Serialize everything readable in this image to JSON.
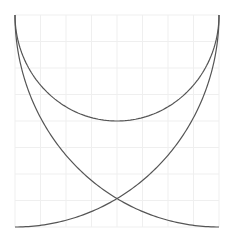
{
  "chart_data": {
    "type": "line",
    "title": "",
    "xlabel": "",
    "ylabel": "",
    "xlim": [
      0,
      8
    ],
    "ylim": [
      0,
      8
    ],
    "grid": true,
    "grid_divisions": 8,
    "legend": null,
    "axes_visible": false,
    "series": [
      {
        "name": "semi-ellipse",
        "shape": "lower half ellipse",
        "center": [
          4,
          8
        ],
        "rx": 4,
        "ry": 4,
        "points": [
          [
            0,
            8
          ],
          [
            1,
            5.35
          ],
          [
            2,
            4.54
          ],
          [
            3,
            4.13
          ],
          [
            4,
            4.0
          ],
          [
            5,
            4.13
          ],
          [
            6,
            4.54
          ],
          [
            7,
            5.35
          ],
          [
            8,
            8
          ]
        ]
      },
      {
        "name": "quarter-ellipse-left-to-right",
        "shape": "quarter ellipse",
        "center": [
          8,
          8
        ],
        "rx": 8,
        "ry": 8,
        "points": [
          [
            0,
            8
          ],
          [
            1,
            4.13
          ],
          [
            2,
            2.71
          ],
          [
            4,
            1.07
          ],
          [
            6,
            0.25
          ],
          [
            8,
            0
          ]
        ]
      },
      {
        "name": "quarter-ellipse-right-to-left",
        "shape": "quarter ellipse",
        "center": [
          0,
          8
        ],
        "rx": 8,
        "ry": 8,
        "points": [
          [
            8,
            8
          ],
          [
            7,
            4.13
          ],
          [
            6,
            2.71
          ],
          [
            4,
            1.07
          ],
          [
            2,
            0.25
          ],
          [
            0,
            0
          ]
        ]
      }
    ],
    "colors": {
      "line": "#555555",
      "grid": "#efefef",
      "background": "#ffffff"
    }
  },
  "plot": {
    "left": 15,
    "top": 15,
    "width": 204,
    "height": 212
  }
}
